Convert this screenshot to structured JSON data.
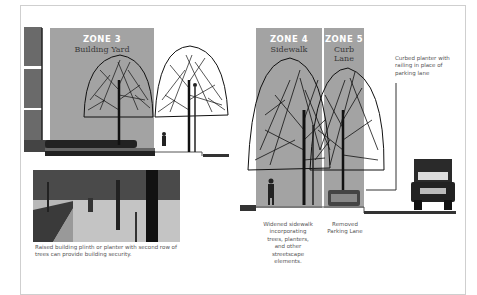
{
  "zones": [
    {
      "title": "ZONE 3",
      "subtitle": "Building Yard"
    },
    {
      "title": "ZONE 4",
      "subtitle": "Sidewalk"
    },
    {
      "title": "ZONE 5",
      "subtitle": "Curb Lane"
    }
  ],
  "callout": {
    "text": "Curbed planter with railing in place of parking lane"
  },
  "captions": {
    "photo": "Raised building plinth or planter with second row of trees can provide building security.",
    "sidewalk": "Widened sidewalk incorporating trees, planters, and other streetscape elements.",
    "parking": "Removed Parking Lane"
  },
  "colors": {
    "zone_fill": "#a3a3a3",
    "zone_title": "#ffffff",
    "frame": "#cfcfcf"
  }
}
